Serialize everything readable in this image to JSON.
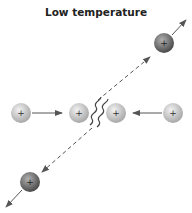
{
  "title": "Low temperature",
  "particles": [
    {
      "id": "incoming-left",
      "x": 21,
      "y": 113,
      "charge": "+",
      "shade": "light"
    },
    {
      "id": "colliding-left",
      "x": 79,
      "y": 113,
      "charge": "+",
      "shade": "light"
    },
    {
      "id": "colliding-right",
      "x": 116,
      "y": 113,
      "charge": "+",
      "shade": "light"
    },
    {
      "id": "incoming-right",
      "x": 173,
      "y": 113,
      "charge": "+",
      "shade": "light"
    },
    {
      "id": "scattered-top-right",
      "x": 164,
      "y": 43,
      "charge": "+",
      "shade": "dark"
    },
    {
      "id": "scattered-bottom-left",
      "x": 30,
      "y": 182,
      "charge": "+",
      "shade": "dark"
    }
  ],
  "colors": {
    "light": "#c8c8c8",
    "dark": "#7a7a7a",
    "arrow": "#555555"
  }
}
